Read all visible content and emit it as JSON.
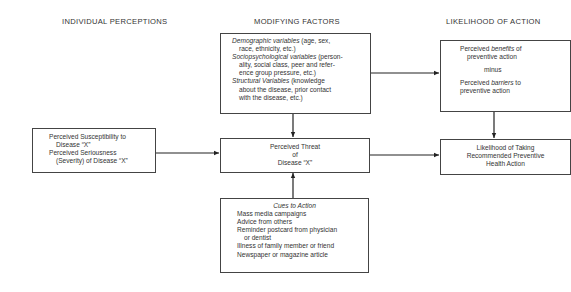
{
  "headings": {
    "individual": "INDIVIDUAL PERCEPTIONS",
    "modifying": "MODIFYING FACTORS",
    "likelihood": "LIKELIHOOD OF ACTION"
  },
  "individual_box": {
    "line1": "Perceived Susceptibility to",
    "line2": "Disease “X”",
    "line3": "Perceived Seriousness",
    "line4": "(Severity) of Disease “X”"
  },
  "modifying_box": {
    "demo_label": "Demographic variables",
    "demo_rest1": " (age, sex,",
    "demo_rest2": "race, ethnicity, etc.)",
    "socio_label": "Sociopsychological variables",
    "socio_rest1": " (person-",
    "socio_rest2": "ality, social class, peer and refer-",
    "socio_rest3": "ence group pressure, etc.)",
    "struct_label": "Structural Variables",
    "struct_rest1": " (knowledge",
    "struct_rest2": "about the disease, prior contact",
    "struct_rest3": "with the disease, etc.)"
  },
  "threat_box": {
    "line1": "Perceived Threat",
    "line2": "of",
    "line3": "Disease “X”"
  },
  "cues_box": {
    "title": "Cues to Action",
    "items": [
      "Mass media campaigns",
      "Advice from others",
      "Reminder postcard from physician",
      "or dentist",
      "Illness of family member or friend",
      "Newspaper or magazine article"
    ]
  },
  "benefits_box": {
    "pre1": "Perceived ",
    "benefits": "benefits",
    "post1": " of",
    "line2": "preventive action",
    "minus": "minus",
    "pre3": "Perceived ",
    "barriers": "barriers",
    "post3": " to",
    "line4": "preventive action"
  },
  "action_box": {
    "line1": "Likelihood of Taking",
    "line2": "Recommended Preventive",
    "line3": "Health Action"
  }
}
